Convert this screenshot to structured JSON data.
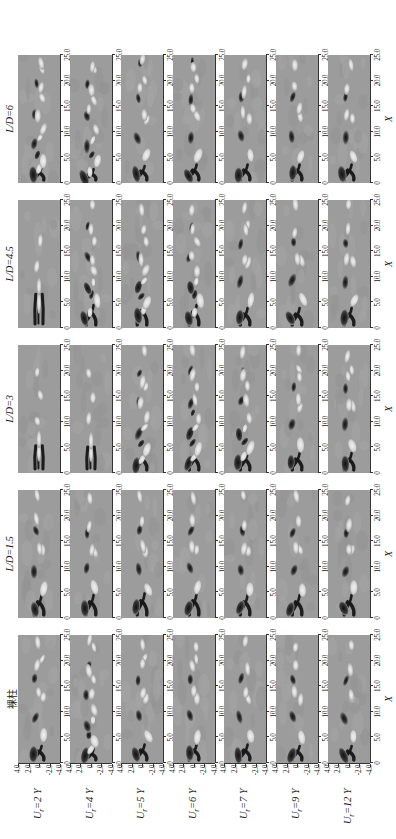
{
  "figure": {
    "type": "contour-grid",
    "background_color": "#ffffff",
    "panel_background_color": "#9c9c9c",
    "orientation": "rotated-90-ccw"
  },
  "columns": [
    {
      "id": "bare",
      "label": "裸柱",
      "is_cjk": true
    },
    {
      "id": "ld15",
      "label": "L/D=1.5",
      "is_cjk": false
    },
    {
      "id": "ld3",
      "label": "L/D=3",
      "is_cjk": false
    },
    {
      "id": "ld45",
      "label": "L/D=4.5",
      "is_cjk": false
    },
    {
      "id": "ld6",
      "label": "L/D=6",
      "is_cjk": false
    }
  ],
  "rows": [
    {
      "id": "ur2",
      "label": "U",
      "sub": "r",
      "value": "=2"
    },
    {
      "id": "ur4",
      "label": "U",
      "sub": "r",
      "value": "=4"
    },
    {
      "id": "ur5",
      "label": "U",
      "sub": "r",
      "value": "=5"
    },
    {
      "id": "ur6",
      "label": "U",
      "sub": "r",
      "value": "=6"
    },
    {
      "id": "ur7",
      "label": "U",
      "sub": "r",
      "value": "=7"
    },
    {
      "id": "ur9",
      "label": "U",
      "sub": "r",
      "value": "=9"
    },
    {
      "id": "ur12",
      "label": "U",
      "sub": "r",
      "value": "=12"
    }
  ],
  "axes": {
    "x": {
      "title": "X",
      "ticks": [
        "0",
        "5.0",
        "10.0",
        "15.0",
        "20.0",
        "25.0"
      ],
      "values": [
        0,
        5,
        10,
        15,
        20,
        25
      ],
      "range": [
        0,
        25
      ]
    },
    "y": {
      "title": "Y",
      "ticks": [
        "4.0",
        "2.0",
        "0",
        "-2.0",
        "-4.0"
      ],
      "values": [
        4,
        2,
        0,
        -2,
        -4
      ],
      "range": [
        -4,
        4
      ]
    }
  },
  "chart_data": {
    "type": "heatmap",
    "title": "",
    "subtitle": "",
    "xlabel": "X",
    "ylabel": "Y",
    "xlim": [
      0,
      25
    ],
    "ylim": [
      -4,
      4
    ],
    "grid": false,
    "legend": "none",
    "colormap": "grayscale-diverging",
    "colormap_low": "#101010",
    "colormap_mid": "#9c9c9c",
    "colormap_high": "#f2f2f2",
    "row_categories": [
      "U_r=2",
      "U_r=4",
      "U_r=5",
      "U_r=6",
      "U_r=7",
      "U_r=9",
      "U_r=12"
    ],
    "col_categories": [
      "裸柱",
      "L/D=1.5",
      "L/D=3",
      "L/D=4.5",
      "L/D=6"
    ],
    "quantity": "instantaneous vorticity",
    "panels": [
      {
        "row": "U_r=2",
        "col": "裸柱",
        "wake_mode": "2S",
        "formation_length": 2.2,
        "vortex_count": 6
      },
      {
        "row": "U_r=2",
        "col": "L/D=1.5",
        "wake_mode": "2S",
        "formation_length": 3.0,
        "vortex_count": 5
      },
      {
        "row": "U_r=2",
        "col": "L/D=3",
        "wake_mode": "elongated-shear-layer",
        "formation_length": 6.5,
        "vortex_count": 3
      },
      {
        "row": "U_r=2",
        "col": "L/D=4.5",
        "wake_mode": "elongated-shear-layer",
        "formation_length": 8.0,
        "vortex_count": 2
      },
      {
        "row": "U_r=2",
        "col": "L/D=6",
        "wake_mode": "2P",
        "formation_length": 2.0,
        "vortex_count": 9
      },
      {
        "row": "U_r=4",
        "col": "裸柱",
        "wake_mode": "2P",
        "formation_length": 1.8,
        "vortex_count": 9
      },
      {
        "row": "U_r=4",
        "col": "L/D=1.5",
        "wake_mode": "2S",
        "formation_length": 3.0,
        "vortex_count": 5
      },
      {
        "row": "U_r=4",
        "col": "L/D=3",
        "wake_mode": "elongated-shear-layer",
        "formation_length": 6.2,
        "vortex_count": 3
      },
      {
        "row": "U_r=4",
        "col": "L/D=4.5",
        "wake_mode": "2P",
        "formation_length": 3.0,
        "vortex_count": 7
      },
      {
        "row": "U_r=4",
        "col": "L/D=6",
        "wake_mode": "2P+",
        "formation_length": 1.8,
        "vortex_count": 10
      },
      {
        "row": "U_r=5",
        "col": "裸柱",
        "wake_mode": "2S",
        "formation_length": 2.4,
        "vortex_count": 6
      },
      {
        "row": "U_r=5",
        "col": "L/D=1.5",
        "wake_mode": "2S",
        "formation_length": 3.2,
        "vortex_count": 5
      },
      {
        "row": "U_r=5",
        "col": "L/D=3",
        "wake_mode": "2P",
        "formation_length": 2.6,
        "vortex_count": 7
      },
      {
        "row": "U_r=5",
        "col": "L/D=4.5",
        "wake_mode": "2P",
        "formation_length": 3.2,
        "vortex_count": 6
      },
      {
        "row": "U_r=5",
        "col": "L/D=6",
        "wake_mode": "2S",
        "formation_length": 2.2,
        "vortex_count": 7
      },
      {
        "row": "U_r=6",
        "col": "裸柱",
        "wake_mode": "2S",
        "formation_length": 2.4,
        "vortex_count": 6
      },
      {
        "row": "U_r=6",
        "col": "L/D=1.5",
        "wake_mode": "2S",
        "formation_length": 3.2,
        "vortex_count": 5
      },
      {
        "row": "U_r=6",
        "col": "L/D=3",
        "wake_mode": "2P",
        "formation_length": 2.8,
        "vortex_count": 7
      },
      {
        "row": "U_r=6",
        "col": "L/D=4.5",
        "wake_mode": "2P",
        "formation_length": 3.0,
        "vortex_count": 7
      },
      {
        "row": "U_r=6",
        "col": "L/D=6",
        "wake_mode": "2S",
        "formation_length": 2.4,
        "vortex_count": 7
      },
      {
        "row": "U_r=7",
        "col": "裸柱",
        "wake_mode": "2S",
        "formation_length": 2.4,
        "vortex_count": 5
      },
      {
        "row": "U_r=7",
        "col": "L/D=1.5",
        "wake_mode": "2S",
        "formation_length": 3.0,
        "vortex_count": 5
      },
      {
        "row": "U_r=7",
        "col": "L/D=3",
        "wake_mode": "2P",
        "formation_length": 2.6,
        "vortex_count": 7
      },
      {
        "row": "U_r=7",
        "col": "L/D=4.5",
        "wake_mode": "2S",
        "formation_length": 2.6,
        "vortex_count": 6
      },
      {
        "row": "U_r=7",
        "col": "L/D=6",
        "wake_mode": "2S",
        "formation_length": 2.4,
        "vortex_count": 6
      },
      {
        "row": "U_r=9",
        "col": "裸柱",
        "wake_mode": "2S",
        "formation_length": 2.2,
        "vortex_count": 5
      },
      {
        "row": "U_r=9",
        "col": "L/D=1.5",
        "wake_mode": "2S",
        "formation_length": 3.0,
        "vortex_count": 5
      },
      {
        "row": "U_r=9",
        "col": "L/D=3",
        "wake_mode": "2S",
        "formation_length": 2.6,
        "vortex_count": 6
      },
      {
        "row": "U_r=9",
        "col": "L/D=4.5",
        "wake_mode": "2S",
        "formation_length": 2.6,
        "vortex_count": 5
      },
      {
        "row": "U_r=9",
        "col": "L/D=6",
        "wake_mode": "2S",
        "formation_length": 2.4,
        "vortex_count": 5
      },
      {
        "row": "U_r=12",
        "col": "裸柱",
        "wake_mode": "2S",
        "formation_length": 2.2,
        "vortex_count": 5
      },
      {
        "row": "U_r=12",
        "col": "L/D=1.5",
        "wake_mode": "2S",
        "formation_length": 3.0,
        "vortex_count": 5
      },
      {
        "row": "U_r=12",
        "col": "L/D=3",
        "wake_mode": "2S",
        "formation_length": 2.6,
        "vortex_count": 6
      },
      {
        "row": "U_r=12",
        "col": "L/D=4.5",
        "wake_mode": "2S",
        "formation_length": 2.6,
        "vortex_count": 5
      },
      {
        "row": "U_r=12",
        "col": "L/D=6",
        "wake_mode": "2S",
        "formation_length": 2.4,
        "vortex_count": 5
      }
    ]
  }
}
